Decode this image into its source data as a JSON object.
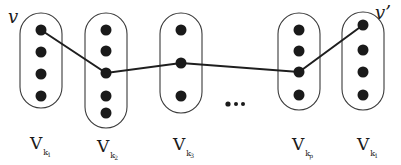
{
  "diagram": {
    "title": "",
    "vertex_labels": {
      "start": "v",
      "end": "v’"
    },
    "sets": [
      {
        "id": "set-1",
        "label_main": "V",
        "label_sub": "k",
        "label_subsub": "1",
        "cx": 41,
        "rx": 21,
        "top": 13,
        "bottom": 108,
        "dots_y": [
          30,
          52,
          74,
          96
        ]
      },
      {
        "id": "set-2",
        "label_main": "V",
        "label_sub": "k",
        "label_subsub": "2",
        "cx": 106,
        "rx": 21,
        "top": 13,
        "bottom": 128,
        "dots_y": [
          30,
          51,
          73,
          96,
          113
        ]
      },
      {
        "id": "set-3",
        "label_main": "V",
        "label_sub": "k",
        "label_subsub": "3",
        "cx": 181,
        "rx": 21,
        "top": 13,
        "bottom": 113,
        "dots_y": [
          30,
          63,
          96
        ]
      },
      {
        "id": "set-p",
        "label_main": "V",
        "label_sub": "k",
        "label_subsub": "p",
        "cx": 299,
        "rx": 21,
        "top": 13,
        "bottom": 110,
        "dots_y": [
          30,
          51,
          72,
          95
        ]
      },
      {
        "id": "set-last",
        "label_main": "V",
        "label_sub": "k",
        "label_subsub": "1",
        "cx": 363,
        "rx": 21,
        "top": 12,
        "bottom": 110,
        "dots_y": [
          25,
          50,
          72,
          95
        ]
      }
    ],
    "path": [
      [
        41,
        30
      ],
      [
        106,
        73
      ],
      [
        181,
        63
      ],
      [
        299,
        72
      ],
      [
        363,
        25
      ]
    ],
    "ellipsis": {
      "text": "...",
      "dots_x": [
        228,
        236,
        243
      ],
      "y": 104
    },
    "colors": {
      "ink": "#1a1a1a",
      "outline": "#3a3a3a",
      "background": "#ffffff"
    }
  }
}
